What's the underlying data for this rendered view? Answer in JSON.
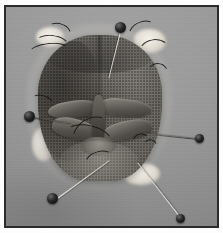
{
  "image": {
    "title": "Pinned insect head specimen",
    "caption": "Grayscale macro photograph of a dissected fly head mounted on a gray dissecting board with black-headed entomological pins",
    "medium": "black-and-white photograph",
    "frame": {
      "border_color": "#2b2b2b",
      "margin_color": "#ffffff",
      "border_width_px": 2
    },
    "background": {
      "name": "dissecting-board",
      "color": "#9a9a9a",
      "description": "uniform matte gray board surface"
    }
  },
  "subject": {
    "name": "insect-head-specimen",
    "label": "Dissected insect head",
    "description": "Bilaterally symmetric head capsule with textured compound eyes, central frontal suture, and a protruding proboscis with paired palps",
    "colors": {
      "capsule_dark": "#625e58",
      "capsule_light": "#7e7a74",
      "proboscis": "#302e2b",
      "cotton": "#f4f2ec"
    },
    "parts": [
      {
        "name": "left-compound-eye",
        "label": "Left compound eye",
        "tone": "dark"
      },
      {
        "name": "right-compound-eye",
        "label": "Right compound eye",
        "tone": "light"
      },
      {
        "name": "frontal-suture",
        "label": "Frontal suture",
        "tone": "dark-line"
      },
      {
        "name": "proboscis",
        "label": "Proboscis",
        "tone": "dark"
      },
      {
        "name": "labellum",
        "label": "Labellum",
        "tone": "mid"
      },
      {
        "name": "maxillary-palps",
        "label": "Maxillary palps",
        "tone": "mid"
      },
      {
        "name": "clypeus",
        "label": "Clypeus",
        "tone": "light"
      }
    ],
    "cotton_tufts": [
      {
        "name": "cotton-tuft-top-left",
        "position": "top-left"
      },
      {
        "name": "cotton-tuft-top-right",
        "position": "top-right"
      },
      {
        "name": "cotton-tuft-bottom-left",
        "position": "bottom-left"
      },
      {
        "name": "cotton-tuft-bottom-right",
        "position": "bottom-right"
      }
    ]
  },
  "pins": {
    "count": 5,
    "head_color": "#111111",
    "shaft_color": "#e0ddd8",
    "items": [
      {
        "name": "pin-top",
        "label": "Top pin",
        "head_x": 118,
        "head_y": 20,
        "angle_deg": 104,
        "length": 46,
        "shaft": "light"
      },
      {
        "name": "pin-left",
        "label": "Left pin",
        "head_x": 27,
        "head_y": 109,
        "angle_deg": 8,
        "length": 42,
        "shaft": "dark"
      },
      {
        "name": "pin-right",
        "label": "Right pin",
        "head_x": 198,
        "head_y": 134,
        "angle_deg": 186,
        "length": 52,
        "shaft": "dark"
      },
      {
        "name": "pin-bottom-left",
        "label": "Bottom-left pin",
        "head_x": 50,
        "head_y": 194,
        "angle_deg": -36,
        "length": 66,
        "shaft": "light"
      },
      {
        "name": "pin-bottom-right",
        "label": "Bottom-right pin",
        "head_x": 178,
        "head_y": 214,
        "angle_deg": -128,
        "length": 70,
        "shaft": "light"
      }
    ]
  },
  "bristles": {
    "name": "setae",
    "label": "Bristles and setae",
    "color": "#16120f",
    "count": 12
  }
}
